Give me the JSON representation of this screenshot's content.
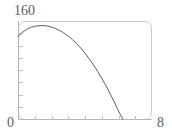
{
  "chart_data": {
    "type": "line",
    "title": "",
    "subtitle": "",
    "xlabel": "",
    "ylabel": "",
    "xlim": [
      0,
      8
    ],
    "ylim": [
      0,
      160
    ],
    "grid": false,
    "legend": null,
    "frame": true,
    "axis_labels": {
      "y_max": "160",
      "origin": "0",
      "x_max": "8"
    },
    "x_ticks": [
      0,
      1,
      2,
      3,
      4,
      5,
      6,
      7,
      8
    ],
    "x_tick_labels": [
      "0",
      "",
      "",
      "",
      "",
      "",
      "",
      "",
      "8"
    ],
    "y_ticks": [
      0,
      20,
      40,
      60,
      80,
      100,
      120,
      140,
      160
    ],
    "y_tick_labels": [
      "0",
      "",
      "",
      "",
      "",
      "",
      "",
      "",
      "160"
    ],
    "series": [
      {
        "name": "trajectory",
        "color": "#4d4d4d",
        "line_width": 0.9,
        "x": [
          0.0,
          0.25,
          0.5,
          0.75,
          1.0,
          1.25,
          1.5,
          1.75,
          2.0,
          2.25,
          2.5,
          2.75,
          3.0,
          3.25,
          3.5,
          3.75,
          4.0,
          4.25,
          4.5,
          4.75,
          5.0,
          5.25,
          5.5,
          5.75,
          6.0,
          6.25,
          6.5,
          6.75,
          7.0,
          7.1
        ],
        "y": [
          135.0,
          141.2,
          146.0,
          149.4,
          151.4,
          152.3,
          152.5,
          151.8,
          150.1,
          147.6,
          144.3,
          140.2,
          135.3,
          129.5,
          123.0,
          115.6,
          107.4,
          98.4,
          88.6,
          78.0,
          66.6,
          54.4,
          41.4,
          27.6,
          13.0,
          0.0,
          0.0,
          0.0,
          0.0,
          0.0
        ]
      }
    ],
    "colors": {
      "curve": "#4d4d4d",
      "frame": "#c9c9c9",
      "axis": "#b5b5b5",
      "tick": "#bdbdbd",
      "label_text": "#5d5d5d",
      "background": "#ffffff"
    }
  }
}
